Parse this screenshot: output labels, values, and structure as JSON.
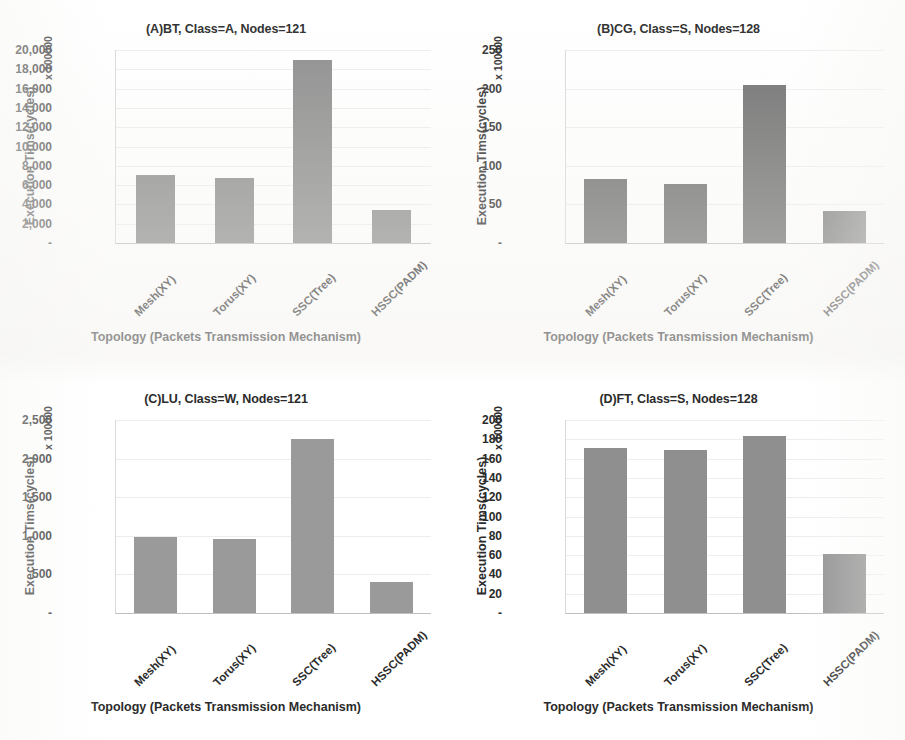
{
  "figure": {
    "background": "#ffffff",
    "panel_count": 4
  },
  "shared": {
    "xlabel": "Topology (Packets Transmission Mechanism)",
    "ylabel": "Execution Tims(cycles)",
    "yunit": "x 100000",
    "categories": [
      "Mesh(XY)",
      "Torus(XY)",
      "SSC(Tree)",
      "HSSC(PADM)"
    ],
    "zero_tick": "-"
  },
  "chart_data": [
    {
      "id": "A",
      "type": "bar",
      "title": "(A)BT, Class=A, Nodes=121",
      "xlabel": "Topology (Packets Transmission Mechanism)",
      "ylabel": "Execution Tims(cycles)",
      "yunit": "x 100000",
      "categories": [
        "Mesh(XY)",
        "Torus(XY)",
        "SSC(Tree)",
        "HSSC(PADM)"
      ],
      "values": [
        7100,
        6700,
        18950,
        3400
      ],
      "ylim": [
        0,
        20000
      ],
      "ytick_step": 2000,
      "yticks": [
        "20,000",
        "18,000",
        "16,000",
        "14,000",
        "12,000",
        "10,000",
        "8,000",
        "6,000",
        "4,000",
        "2,000",
        "-"
      ],
      "ytick_values": [
        20000,
        18000,
        16000,
        14000,
        12000,
        10000,
        8000,
        6000,
        4000,
        2000,
        0
      ],
      "bar_color": "#8c8c8c",
      "grid": true,
      "legend": "none"
    },
    {
      "id": "B",
      "type": "bar",
      "title": "(B)CG, Class=S, Nodes=128",
      "xlabel": "Topology (Packets Transmission Mechanism)",
      "ylabel": "Execution Tims(cycles)",
      "yunit": "x 100000",
      "categories": [
        "Mesh(XY)",
        "Torus(XY)",
        "SSC(Tree)",
        "HSSC(PADM)"
      ],
      "values": [
        83,
        77,
        205,
        42
      ],
      "ylim": [
        0,
        250
      ],
      "ytick_step": 50,
      "yticks": [
        "250",
        "200",
        "150",
        "100",
        "50",
        "-"
      ],
      "ytick_values": [
        250,
        200,
        150,
        100,
        50,
        0
      ],
      "bar_color": "#6e6e6e",
      "grid": true,
      "legend": "none"
    },
    {
      "id": "C",
      "type": "bar",
      "title": "(C)LU, Class=W, Nodes=121",
      "xlabel": "Topology (Packets Transmission Mechanism)",
      "ylabel": "Execution Tims(cycles)",
      "yunit": "x 100000",
      "categories": [
        "Mesh(XY)",
        "Torus(XY)",
        "SSC(Tree)",
        "HSSC(PADM)"
      ],
      "values": [
        985,
        965,
        2260,
        400
      ],
      "ylim": [
        0,
        2500
      ],
      "ytick_step": 500,
      "yticks": [
        "2,500",
        "2,000",
        "1,500",
        "1,000",
        "500",
        "-"
      ],
      "ytick_values": [
        2500,
        2000,
        1500,
        1000,
        500,
        0
      ],
      "bar_color": "#9a9a9a",
      "grid": true,
      "legend": "none"
    },
    {
      "id": "D",
      "type": "bar",
      "title": "(D)FT, Class=S, Nodes=128",
      "xlabel": "Topology (Packets Transmission Mechanism)",
      "ylabel": "Execution Tims(cycles)",
      "yunit": "x 100000",
      "categories": [
        "Mesh(XY)",
        "Torus(XY)",
        "SSC(Tree)",
        "HSSC(PADM)"
      ],
      "values": [
        171,
        169,
        183,
        61
      ],
      "ylim": [
        0,
        200
      ],
      "ytick_step": 20,
      "yticks": [
        "200",
        "180",
        "160",
        "140",
        "120",
        "100",
        "80",
        "60",
        "40",
        "20",
        "-"
      ],
      "ytick_values": [
        200,
        180,
        160,
        140,
        120,
        100,
        80,
        60,
        40,
        20,
        0
      ],
      "bar_color": "#8f8f8f",
      "grid": true,
      "legend": "none"
    }
  ]
}
